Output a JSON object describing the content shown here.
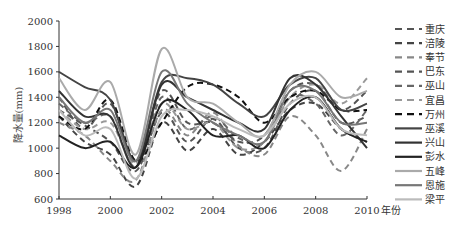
{
  "chart_data": {
    "type": "line",
    "title": "",
    "xlabel": "年份",
    "ylabel": "降水量(mm)",
    "xlim": [
      1998,
      2010
    ],
    "ylim": [
      600,
      2000
    ],
    "x_ticks": [
      "1998",
      "2000",
      "2002",
      "2004",
      "2006",
      "2008",
      "2010"
    ],
    "y_ticks": [
      "600",
      "800",
      "1000",
      "1200",
      "1400",
      "1600",
      "1800",
      "2000"
    ],
    "grid": false,
    "legend_position": "right",
    "x": [
      1998,
      1999,
      2000,
      2001,
      2002,
      2003,
      2004,
      2005,
      2006,
      2007,
      2008,
      2009,
      2010
    ],
    "series": [
      {
        "name": "重庆",
        "style": "dashed",
        "color": "#555555",
        "values": [
          1300,
          1180,
          1050,
          820,
          1280,
          1050,
          1230,
          1000,
          1000,
          1350,
          1450,
          1200,
          1250
        ]
      },
      {
        "name": "涪陵",
        "style": "dashed",
        "color": "#444444",
        "values": [
          1250,
          1050,
          950,
          700,
          1200,
          980,
          1150,
          950,
          1050,
          1300,
          1350,
          1150,
          1050
        ]
      },
      {
        "name": "奉节",
        "style": "dashed",
        "color": "#888888",
        "values": [
          1200,
          1100,
          900,
          750,
          1300,
          1100,
          1280,
          1020,
          950,
          1250,
          1100,
          820,
          1150
        ]
      },
      {
        "name": "巴东",
        "style": "dashed",
        "color": "#555555",
        "values": [
          1400,
          1150,
          1350,
          900,
          1450,
          1200,
          1200,
          1050,
          1100,
          1450,
          1500,
          1300,
          1450
        ]
      },
      {
        "name": "巫山",
        "style": "dashed",
        "color": "#666666",
        "values": [
          1350,
          1200,
          1250,
          850,
          1400,
          1150,
          1250,
          1080,
          1050,
          1400,
          1350,
          1100,
          1300
        ]
      },
      {
        "name": "宜昌",
        "style": "dashed",
        "color": "#999999",
        "values": [
          1300,
          1150,
          1200,
          880,
          1350,
          1150,
          1200,
          1000,
          1050,
          1400,
          1500,
          1350,
          1550
        ]
      },
      {
        "name": "万州",
        "style": "dashed",
        "color": "#111111",
        "values": [
          1250,
          1150,
          1380,
          900,
          1200,
          1480,
          1500,
          1400,
          1200,
          1400,
          1450,
          1300,
          1300
        ]
      },
      {
        "name": "巫溪",
        "style": "solid",
        "color": "#444444",
        "values": [
          1600,
          1480,
          1380,
          900,
          1520,
          1550,
          1500,
          1350,
          1250,
          1500,
          1550,
          1300,
          1350
        ]
      },
      {
        "name": "兴山",
        "style": "solid",
        "color": "#333333",
        "values": [
          1450,
          1250,
          1250,
          850,
          1500,
          1400,
          1300,
          1200,
          1150,
          1550,
          1500,
          1250,
          1000
        ]
      },
      {
        "name": "彭水",
        "style": "solid",
        "color": "#222222",
        "values": [
          1100,
          1000,
          1050,
          850,
          1350,
          1300,
          1100,
          1100,
          1000,
          1300,
          1400,
          1150,
          1050
        ]
      },
      {
        "name": "五峰",
        "style": "solid",
        "color": "#aaaaaa",
        "values": [
          1550,
          1300,
          1520,
          950,
          1780,
          1400,
          1350,
          1200,
          1100,
          1500,
          1600,
          1400,
          1450
        ]
      },
      {
        "name": "恩施",
        "style": "solid",
        "color": "#777777",
        "values": [
          1400,
          1200,
          1300,
          900,
          1600,
          1350,
          1200,
          1100,
          1050,
          1450,
          1450,
          1200,
          1200
        ]
      },
      {
        "name": "梁平",
        "style": "solid",
        "color": "#bbbbbb",
        "values": [
          1300,
          1100,
          1150,
          760,
          1250,
          1300,
          1250,
          1150,
          1100,
          1350,
          1400,
          1150,
          1100
        ]
      }
    ]
  }
}
